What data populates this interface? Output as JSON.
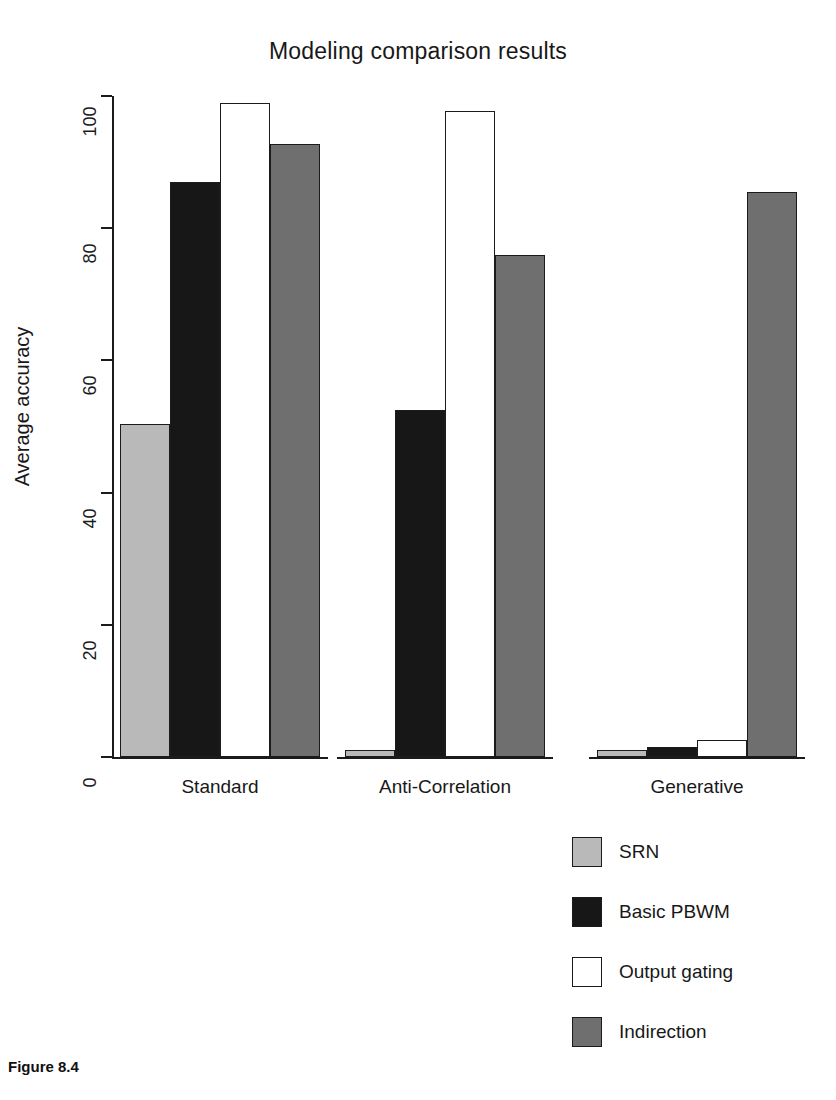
{
  "chart_data": {
    "type": "bar",
    "title": "Modeling comparison results",
    "xlabel": "",
    "ylabel": "Average accuracy",
    "ylim": [
      0,
      100
    ],
    "yticks": [
      0,
      20,
      40,
      60,
      80,
      100
    ],
    "grid": false,
    "legend_position": "bottom-right",
    "categories": [
      "Standard",
      "Anti-Correlation",
      "Generative"
    ],
    "series": [
      {
        "name": "SRN",
        "color": "#b9b9b9",
        "values": [
          50.4,
          1.0,
          1.0
        ]
      },
      {
        "name": "Basic PBWM",
        "color": "#171717",
        "values": [
          87.0,
          52.5,
          1.5
        ]
      },
      {
        "name": "Output gating",
        "color": "#ffffff",
        "values": [
          99.0,
          97.8,
          2.5
        ]
      },
      {
        "name": "Indirection",
        "color": "#6f6f6f",
        "values": [
          92.8,
          76.0,
          85.5
        ]
      }
    ]
  },
  "caption": "Figure 8.4",
  "axis": {
    "tick_labels": [
      "0",
      "20",
      "40",
      "60",
      "80",
      "100"
    ]
  }
}
